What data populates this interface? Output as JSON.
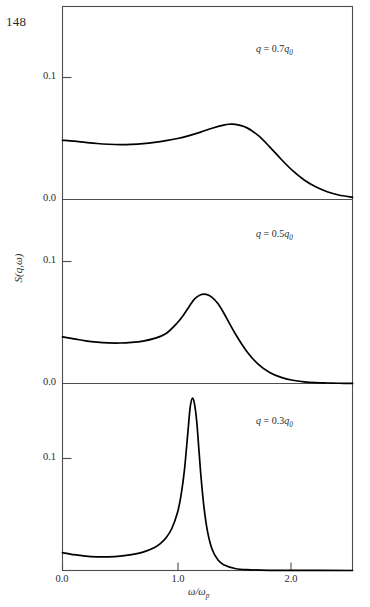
{
  "page": {
    "page_number": "148"
  },
  "figure": {
    "y_axis_label": "S(q,ω)",
    "x_axis_label": "ω/ω",
    "x_axis_label_sub": "p",
    "line_color": "#000000",
    "frame_color": "#4d4d4d"
  },
  "axes": {
    "x_ticks": [
      "0.0",
      "1.0",
      "2.0"
    ],
    "x_tick_values": [
      0.0,
      1.0,
      2.0
    ],
    "panel1_y_ticks": [
      "0.1",
      "0.0"
    ],
    "panel2_y_ticks": [
      "0.1",
      "0.0"
    ],
    "panel3_y_ticks": [
      "0.1"
    ]
  },
  "panels": [
    {
      "id": "panel-q07",
      "annotation_q": "q",
      "annotation_eq": " = 0.7",
      "annotation_q0": "q",
      "annotation_sub": "0",
      "annotation_full": "q = 0.7q₀"
    },
    {
      "id": "panel-q05",
      "annotation_q": "q",
      "annotation_eq": " = 0.5",
      "annotation_q0": "q",
      "annotation_sub": "0",
      "annotation_full": "q = 0.5q₀"
    },
    {
      "id": "panel-q03",
      "annotation_q": "q",
      "annotation_eq": " = 0.3",
      "annotation_q0": "q",
      "annotation_sub": "0",
      "annotation_full": "q = 0.3q₀"
    }
  ],
  "chart_data": {
    "type": "line",
    "title": "",
    "xlabel": "ω/ωp",
    "ylabel": "S(q,ω)",
    "xlim": [
      0.0,
      2.52
    ],
    "grid": false,
    "legend": "none",
    "panel_layout": "three stacked panels sharing x axis",
    "series": [
      {
        "name": "q = 0.7q0",
        "panel": 1,
        "ylim": [
          0.0,
          0.155
        ],
        "yticks": [
          0.0,
          0.1
        ],
        "x": [
          0.0,
          0.1,
          0.2,
          0.3,
          0.4,
          0.5,
          0.6,
          0.7,
          0.8,
          0.9,
          1.0,
          1.1,
          1.2,
          1.3,
          1.4,
          1.45,
          1.5,
          1.6,
          1.7,
          1.8,
          1.9,
          2.0,
          2.1,
          2.2,
          2.3,
          2.4,
          2.52
        ],
        "y": [
          0.0485,
          0.0478,
          0.0468,
          0.0459,
          0.0453,
          0.045,
          0.0452,
          0.0458,
          0.0468,
          0.0482,
          0.05,
          0.0524,
          0.0552,
          0.0584,
          0.061,
          0.0617,
          0.0616,
          0.0589,
          0.0525,
          0.0432,
          0.033,
          0.0236,
          0.016,
          0.0104,
          0.0064,
          0.0037,
          0.0018
        ]
      },
      {
        "name": "q = 0.5q0",
        "panel": 2,
        "ylim": [
          0.0,
          0.155
        ],
        "yticks": [
          0.0,
          0.1
        ],
        "x": [
          0.0,
          0.1,
          0.2,
          0.3,
          0.4,
          0.5,
          0.6,
          0.7,
          0.8,
          0.9,
          1.0,
          1.05,
          1.1,
          1.15,
          1.2,
          1.25,
          1.3,
          1.35,
          1.4,
          1.5,
          1.6,
          1.7,
          1.8,
          1.9,
          2.0,
          2.1,
          2.2,
          2.3,
          2.4,
          2.52
        ],
        "y": [
          0.0382,
          0.0366,
          0.035,
          0.0339,
          0.0333,
          0.0332,
          0.0337,
          0.0348,
          0.037,
          0.041,
          0.05,
          0.056,
          0.063,
          0.0695,
          0.0728,
          0.073,
          0.0706,
          0.0655,
          0.058,
          0.041,
          0.0265,
          0.0158,
          0.009,
          0.005,
          0.0027,
          0.0014,
          0.0007,
          0.0004,
          0.0002,
          0.0001
        ]
      },
      {
        "name": "q = 0.3q0",
        "panel": 3,
        "ylim": [
          0.0,
          0.22
        ],
        "yticks": [
          0.1
        ],
        "x": [
          0.0,
          0.1,
          0.2,
          0.3,
          0.4,
          0.5,
          0.6,
          0.7,
          0.8,
          0.85,
          0.9,
          0.95,
          1.0,
          1.03,
          1.06,
          1.09,
          1.11,
          1.13,
          1.15,
          1.17,
          1.2,
          1.23,
          1.26,
          1.3,
          1.35,
          1.4,
          1.5,
          1.6,
          1.8,
          2.0,
          2.52
        ],
        "y": [
          0.016,
          0.0141,
          0.0128,
          0.0122,
          0.0122,
          0.0128,
          0.0141,
          0.0164,
          0.0206,
          0.024,
          0.0292,
          0.0375,
          0.052,
          0.067,
          0.09,
          0.124,
          0.146,
          0.154,
          0.147,
          0.129,
          0.088,
          0.056,
          0.035,
          0.019,
          0.0095,
          0.0052,
          0.0018,
          0.0007,
          0.0002,
          0.0001,
          0.0
        ]
      }
    ]
  }
}
